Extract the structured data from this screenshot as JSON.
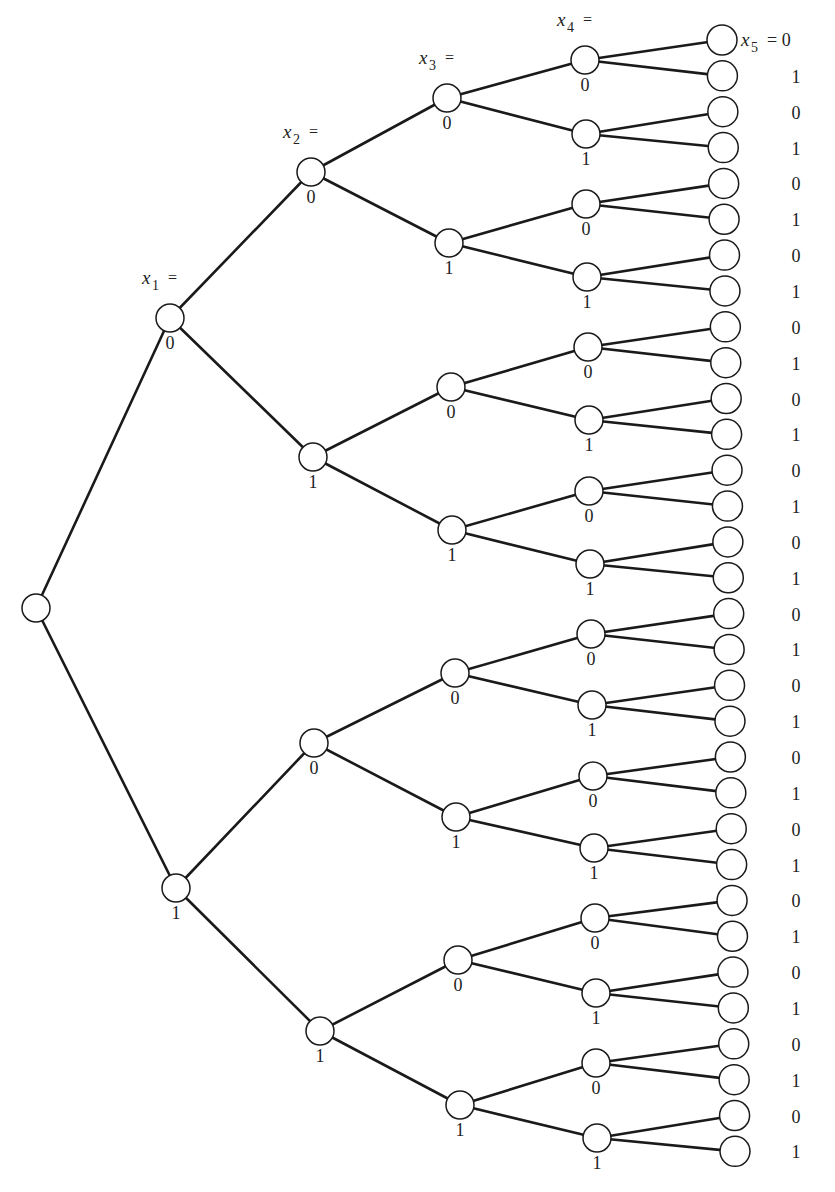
{
  "diagram": {
    "type": "binary-decision-tree",
    "depth": 5,
    "branch_values": [
      "0",
      "1"
    ],
    "level_headers": [
      {
        "var": "x",
        "sub": "1",
        "eq": "=",
        "level": 1
      },
      {
        "var": "x",
        "sub": "2",
        "eq": "=",
        "level": 2
      },
      {
        "var": "x",
        "sub": "3",
        "eq": "=",
        "level": 3
      },
      {
        "var": "x",
        "sub": "4",
        "eq": "=",
        "level": 4
      },
      {
        "var": "x",
        "sub": "5",
        "eq": "= 0",
        "level": 5
      }
    ],
    "root": {
      "x": 36,
      "y": 608
    },
    "levels": [
      {
        "level": 1,
        "x": [
          170,
          176
        ],
        "y": [
          318,
          888
        ]
      },
      {
        "level": 2,
        "x": [
          311,
          313,
          314,
          320
        ],
        "y": [
          172,
          457,
          743,
          1031
        ]
      },
      {
        "level": 3,
        "x": [
          447,
          449,
          451,
          452,
          455,
          456,
          458,
          460
        ],
        "y": [
          98,
          243,
          387,
          530,
          673,
          817,
          960,
          1105
        ]
      },
      {
        "level": 4,
        "x": [
          585,
          586,
          586,
          587,
          588,
          589,
          589,
          590,
          591,
          592,
          593,
          594,
          595,
          596,
          596,
          597
        ],
        "y": [
          60,
          134,
          204,
          277,
          347,
          420,
          491,
          564,
          634,
          705,
          776,
          848,
          918,
          993,
          1063,
          1138
        ]
      },
      {
        "level": 5,
        "x_start": 722,
        "x_end": 735,
        "y_start": 40,
        "y_step": 35.85,
        "count": 32
      }
    ],
    "leaf_values": [
      "0",
      "1",
      "0",
      "1",
      "0",
      "1",
      "0",
      "1",
      "0",
      "1",
      "0",
      "1",
      "0",
      "1",
      "0",
      "1",
      "0",
      "1",
      "0",
      "1",
      "0",
      "1",
      "0",
      "1",
      "0",
      "1",
      "0",
      "1",
      "0",
      "1",
      "0",
      "1"
    ],
    "leaf_label_x": 796,
    "node_radius": 14
  }
}
